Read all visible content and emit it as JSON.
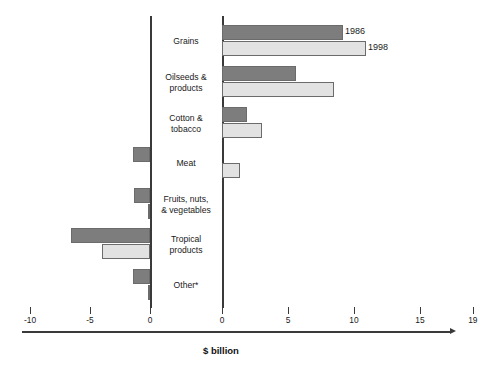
{
  "chart_data": {
    "type": "bar",
    "title": "",
    "subtitle": "",
    "orientation": "horizontal",
    "xlabel": "$ billion",
    "ylabel": "",
    "grid": false,
    "legend_position": "inline-right-of-first-bars",
    "axis_note": "Broken dual x-axis: left segment runs -10 to 0, right segment runs 0 to 19",
    "left_axis_ticks": [
      "-10",
      "-5",
      "0"
    ],
    "left_axis_tick_values": [
      -10,
      -5,
      0
    ],
    "right_axis_ticks": [
      "0",
      "5",
      "10",
      "15",
      "19"
    ],
    "right_axis_tick_values": [
      0,
      5,
      10,
      15,
      19
    ],
    "xlim_left": [
      -10,
      0
    ],
    "xlim_right": [
      0,
      19
    ],
    "categories": [
      "Grains",
      "Oilseeds & products",
      "Cotton & tobacco",
      "Meat",
      "Fruits, nuts, & vegetables",
      "Tropical products",
      "Other*"
    ],
    "category_lines": [
      [
        "Grains"
      ],
      [
        "Oilseeds &",
        "products"
      ],
      [
        "Cotton &",
        "tobacco"
      ],
      [
        "Meat"
      ],
      [
        "Fruits, nuts,",
        "& vegetables"
      ],
      [
        "Tropical",
        "products"
      ],
      [
        "Other*"
      ]
    ],
    "series": [
      {
        "name": "1986",
        "color": "#7d7d7d",
        "values": [
          9.2,
          5.6,
          1.9,
          -1.4,
          -1.3,
          -6.6,
          -1.4
        ]
      },
      {
        "name": "1998",
        "color": "#e2e2e2",
        "values": [
          10.9,
          8.5,
          3.0,
          1.4,
          -0.2,
          -4.0,
          -0.2
        ]
      }
    ],
    "legend": [
      {
        "label": "1986",
        "color": "#7d7d7d"
      },
      {
        "label": "1998",
        "color": "#e2e2e2"
      }
    ]
  },
  "colors": {
    "series_1986": "#7d7d7d",
    "series_1998": "#e2e2e2",
    "axis": "#3a3a3a",
    "bar_border": "#6b6b6b",
    "background": "#ffffff",
    "text": "#1a1a1a"
  }
}
